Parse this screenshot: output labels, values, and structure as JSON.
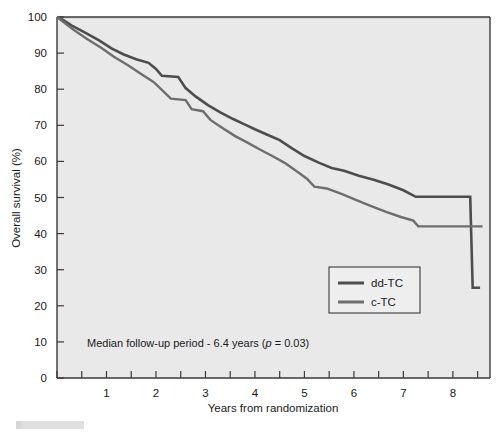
{
  "chart_data": {
    "type": "line",
    "title": "",
    "subtitle": "",
    "xlabel": "Years from randomization",
    "ylabel": "Overall survival (%)",
    "xlim": [
      0,
      8.75
    ],
    "ylim": [
      0,
      100
    ],
    "xticks": [
      0,
      0.5,
      1,
      1.5,
      2,
      2.5,
      3,
      3.5,
      4,
      4.5,
      5,
      5.5,
      6,
      6.5,
      7,
      7.5,
      8,
      8.5
    ],
    "xticklabels": [
      "",
      "",
      "1",
      "",
      "2",
      "",
      "3",
      "",
      "4",
      "",
      "5",
      "",
      "6",
      "",
      "7",
      "",
      "8",
      ""
    ],
    "yticks": [
      0,
      10,
      20,
      30,
      40,
      50,
      60,
      70,
      80,
      90,
      100
    ],
    "yticklabels": [
      "0",
      "10",
      "20",
      "30",
      "40",
      "50",
      "60",
      "70",
      "80",
      "90",
      "100"
    ],
    "grid": false,
    "legend_position": "center-right",
    "annotation": "Median follow-up period - 6.4 years (p = 0.03)",
    "annotation_parts": {
      "before": "Median follow-up period - 6.4 years (",
      "italic": "p",
      "after": " = 0.03)"
    },
    "series": [
      {
        "name": "dd-TC",
        "color": "#4d4d4d",
        "linewidth": 2.6,
        "points": [
          [
            0.0,
            100.0
          ],
          [
            0.12,
            99.2
          ],
          [
            0.3,
            97.6
          ],
          [
            0.55,
            95.8
          ],
          [
            0.85,
            93.5
          ],
          [
            1.1,
            91.3
          ],
          [
            1.35,
            89.6
          ],
          [
            1.6,
            88.3
          ],
          [
            1.85,
            87.3
          ],
          [
            2.0,
            85.6
          ],
          [
            2.12,
            83.7
          ],
          [
            2.45,
            83.4
          ],
          [
            2.6,
            80.3
          ],
          [
            2.8,
            78.0
          ],
          [
            3.05,
            75.6
          ],
          [
            3.3,
            73.6
          ],
          [
            3.55,
            71.8
          ],
          [
            3.8,
            70.2
          ],
          [
            4.0,
            68.9
          ],
          [
            4.25,
            67.4
          ],
          [
            4.5,
            65.9
          ],
          [
            4.75,
            63.6
          ],
          [
            5.0,
            61.5
          ],
          [
            5.3,
            59.6
          ],
          [
            5.55,
            58.2
          ],
          [
            5.8,
            57.4
          ],
          [
            6.1,
            56.0
          ],
          [
            6.4,
            54.9
          ],
          [
            6.7,
            53.6
          ],
          [
            7.0,
            52.0
          ],
          [
            7.25,
            50.2
          ],
          [
            8.35,
            50.2
          ],
          [
            8.4,
            25.0
          ],
          [
            8.55,
            25.0
          ]
        ]
      },
      {
        "name": "c-TC",
        "color": "#6e6e6e",
        "linewidth": 2.4,
        "points": [
          [
            0.0,
            100.0
          ],
          [
            0.15,
            98.4
          ],
          [
            0.35,
            96.3
          ],
          [
            0.6,
            94.0
          ],
          [
            0.9,
            91.4
          ],
          [
            1.15,
            89.0
          ],
          [
            1.45,
            86.5
          ],
          [
            1.7,
            84.2
          ],
          [
            1.95,
            82.0
          ],
          [
            2.15,
            79.4
          ],
          [
            2.3,
            77.4
          ],
          [
            2.6,
            77.0
          ],
          [
            2.72,
            74.5
          ],
          [
            2.95,
            73.9
          ],
          [
            3.1,
            71.5
          ],
          [
            3.35,
            69.2
          ],
          [
            3.6,
            67.0
          ],
          [
            3.85,
            65.2
          ],
          [
            4.1,
            63.3
          ],
          [
            4.35,
            61.5
          ],
          [
            4.6,
            59.6
          ],
          [
            4.85,
            57.2
          ],
          [
            5.05,
            55.2
          ],
          [
            5.2,
            53.0
          ],
          [
            5.45,
            52.5
          ],
          [
            5.75,
            51.0
          ],
          [
            6.05,
            49.3
          ],
          [
            6.35,
            47.6
          ],
          [
            6.65,
            46.0
          ],
          [
            6.95,
            44.6
          ],
          [
            7.2,
            43.6
          ],
          [
            7.3,
            42.0
          ],
          [
            8.6,
            42.0
          ]
        ]
      }
    ]
  },
  "axes": {
    "ylabel": "Overall survival (%)",
    "xlabel": "Years from randomization"
  },
  "legend": {
    "entries": [
      {
        "label": "dd-TC",
        "color": "#4d4d4d"
      },
      {
        "label": "c-TC",
        "color": "#6e6e6e"
      }
    ]
  },
  "colors": {
    "plot_background": "#e9e9e9",
    "page_background": "#ffffff",
    "axis": "#3a3a3a",
    "dd_tc": "#4d4d4d",
    "c_tc": "#6e6e6e",
    "text": "#1a1a1a"
  }
}
